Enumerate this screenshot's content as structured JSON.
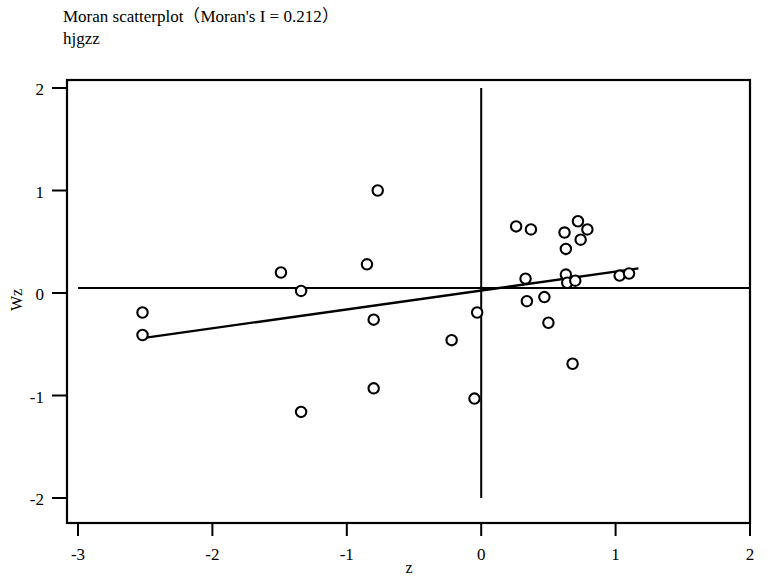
{
  "chart_data": {
    "type": "scatter",
    "title": "Moran scatterplot（Moran's I = 0.212）",
    "subtitle": "hjgzz",
    "morans_i": 0.212,
    "variable": "hjgzz",
    "xlabel": "z",
    "ylabel": "Wz",
    "xlim": [
      -3,
      2
    ],
    "ylim": [
      -2,
      2
    ],
    "xticks": [
      -3,
      -2,
      -1,
      0,
      1,
      2
    ],
    "xticklabels": [
      "-3",
      "-2",
      "-1",
      "0",
      "1",
      "2"
    ],
    "yticks": [
      2,
      1,
      0,
      -1,
      -2
    ],
    "yticklabels": [
      "2",
      "1",
      "0",
      "-1",
      "-2"
    ],
    "grid": false,
    "legend": false,
    "reference_lines": {
      "horizontal_y": 0.05,
      "vertical_x": 0.0
    },
    "fit_line": {
      "x_start": -2.52,
      "y_start": -0.44,
      "x_end": 1.17,
      "y_end": 0.24
    },
    "marker": "open-circle",
    "points": [
      {
        "x": -2.52,
        "y": -0.19
      },
      {
        "x": -2.52,
        "y": -0.41
      },
      {
        "x": -1.49,
        "y": 0.2
      },
      {
        "x": -1.34,
        "y": 0.02
      },
      {
        "x": -1.34,
        "y": -1.16
      },
      {
        "x": -0.85,
        "y": 0.28
      },
      {
        "x": -0.8,
        "y": -0.26
      },
      {
        "x": -0.77,
        "y": 1.0
      },
      {
        "x": -0.8,
        "y": -0.93
      },
      {
        "x": -0.22,
        "y": -0.46
      },
      {
        "x": -0.03,
        "y": -0.19
      },
      {
        "x": -0.05,
        "y": -1.03
      },
      {
        "x": 0.26,
        "y": 0.65
      },
      {
        "x": 0.37,
        "y": 0.62
      },
      {
        "x": 0.33,
        "y": 0.14
      },
      {
        "x": 0.34,
        "y": -0.08
      },
      {
        "x": 0.47,
        "y": -0.04
      },
      {
        "x": 0.5,
        "y": -0.29
      },
      {
        "x": 0.62,
        "y": 0.59
      },
      {
        "x": 0.63,
        "y": 0.43
      },
      {
        "x": 0.68,
        "y": -0.69
      },
      {
        "x": 0.72,
        "y": 0.7
      },
      {
        "x": 0.79,
        "y": 0.62
      },
      {
        "x": 0.74,
        "y": 0.52
      },
      {
        "x": 0.63,
        "y": 0.18
      },
      {
        "x": 0.64,
        "y": 0.1
      },
      {
        "x": 0.7,
        "y": 0.12
      },
      {
        "x": 1.03,
        "y": 0.17
      },
      {
        "x": 1.1,
        "y": 0.19
      }
    ]
  },
  "axes_geometry": {
    "plot_left_px": 78,
    "plot_right_px": 750,
    "plot_top_px": 88,
    "plot_bottom_px": 498,
    "frame_left_px": 67,
    "frame_right_px": 750,
    "frame_top_px": 80,
    "frame_bottom_px": 523
  }
}
